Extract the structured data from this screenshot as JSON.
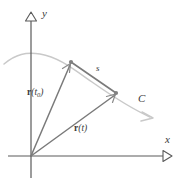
{
  "figure": {
    "kind": "vector-calculus-arc-length-diagram",
    "width": 180,
    "height": 189,
    "background_color": "#ffffff"
  },
  "colors": {
    "axis": "#5a5a5a",
    "curve": "#c9c9c9",
    "vector": "#7a7a7a",
    "chord": "#7a7a7a",
    "point": "#808080",
    "text": "#3a3a3a"
  },
  "axes": {
    "origin": {
      "x": 31,
      "y": 156
    },
    "x_axis": {
      "label": "x",
      "label_pos": {
        "x": 165,
        "y": 134
      },
      "start": {
        "x": 8,
        "y": 156
      },
      "end": {
        "x": 163,
        "y": 156
      },
      "arrowhead": "open-triangle-right"
    },
    "y_axis": {
      "label": "y",
      "label_pos": {
        "x": 42,
        "y": 8
      },
      "start": {
        "x": 31,
        "y": 178
      },
      "end": {
        "x": 31,
        "y": 21
      },
      "arrowhead": "open-triangle-up"
    }
  },
  "curve": {
    "name": "C",
    "label": "C",
    "label_pos": {
      "x": 138,
      "y": 93
    },
    "path": "M 4,64 C 16,54 26,52 40,54 C 58,57 72,68 92,82 C 112,96 130,108 150,117",
    "arrowhead_at": {
      "x": 150,
      "y": 117
    },
    "arrowhead": "open-chevron-right-down"
  },
  "points": [
    {
      "name": "point-t0",
      "x": 71,
      "y": 62,
      "radius": 2.1
    },
    {
      "name": "point-t",
      "x": 116,
      "y": 93,
      "radius": 2.1
    }
  ],
  "vectors": [
    {
      "name": "r-t0",
      "label_html": "<span class=\"bold-r\">r</span><span class=\"ital\">(t</span><sub>0</sub><span class=\"ital\">)</span>",
      "label_text": "r(t0)",
      "label_pos": {
        "x": 27,
        "y": 88
      },
      "from": {
        "x": 31,
        "y": 156
      },
      "to": {
        "x": 70,
        "y": 64
      }
    },
    {
      "name": "r-t",
      "label_html": "<span class=\"bold-r\">r</span><span class=\"ital\">(t)</span>",
      "label_text": "r(t)",
      "label_pos": {
        "x": 74,
        "y": 124
      },
      "from": {
        "x": 31,
        "y": 156
      },
      "to": {
        "x": 115,
        "y": 95
      }
    }
  ],
  "chord": {
    "name": "arc-length-chord",
    "label": "s",
    "label_pos": {
      "x": 96,
      "y": 64
    },
    "from": {
      "x": 71,
      "y": 62
    },
    "to": {
      "x": 116,
      "y": 93
    }
  }
}
